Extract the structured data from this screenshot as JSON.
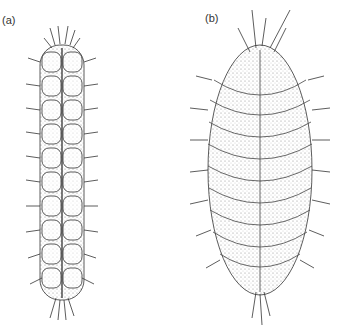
{
  "figure": {
    "panels": [
      {
        "label": "(a)",
        "subject": "elongated scale worm, dorsal view, paired segmental elytra with marginal spines"
      },
      {
        "label": "(b)",
        "subject": "broad oval scale worm, dorsal view, overlapping elytra with lateral chaetae"
      }
    ],
    "colors": {
      "ink": "#333333",
      "stipple": "#777777",
      "background": "#ffffff"
    }
  }
}
